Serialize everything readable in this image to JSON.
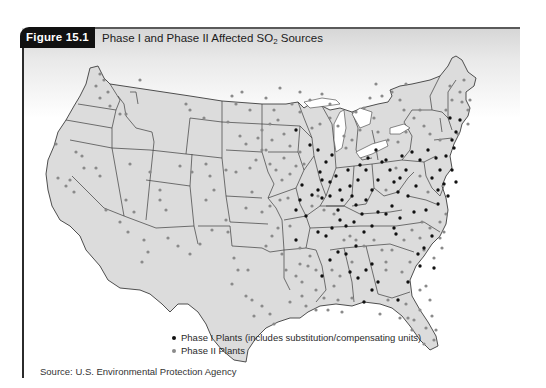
{
  "figure": {
    "label": "Figure 15.1",
    "title_prefix": "Phase I and Phase II Affected SO",
    "title_subscript": "2",
    "title_suffix": " Sources"
  },
  "legend": {
    "items": [
      {
        "label": "Phase I Plants (includes substitution/compensating units)",
        "color": "#111111"
      },
      {
        "label": "Phase II Plants",
        "color": "#8a8a8a"
      }
    ]
  },
  "source": "Source: U.S. Environmental Protection Agency",
  "colors": {
    "land": "#dcdcdc",
    "border": "#3c3c3c",
    "phase1": "#111111",
    "phase2": "#8a8a8a"
  },
  "map": {
    "phase1_points": [
      [
        296,
        130
      ],
      [
        310,
        145
      ],
      [
        318,
        150
      ],
      [
        332,
        155
      ],
      [
        326,
        162
      ],
      [
        320,
        172
      ],
      [
        322,
        180
      ],
      [
        318,
        190
      ],
      [
        312,
        195
      ],
      [
        302,
        185
      ],
      [
        300,
        200
      ],
      [
        296,
        210
      ],
      [
        330,
        182
      ],
      [
        336,
        176
      ],
      [
        340,
        190
      ],
      [
        342,
        200
      ],
      [
        338,
        210
      ],
      [
        348,
        170
      ],
      [
        350,
        186
      ],
      [
        352,
        196
      ],
      [
        356,
        205
      ],
      [
        358,
        180
      ],
      [
        360,
        165
      ],
      [
        366,
        170
      ],
      [
        368,
        158
      ],
      [
        376,
        150
      ],
      [
        386,
        160
      ],
      [
        378,
        180
      ],
      [
        372,
        190
      ],
      [
        366,
        200
      ],
      [
        362,
        214
      ],
      [
        354,
        222
      ],
      [
        346,
        226
      ],
      [
        340,
        220
      ],
      [
        332,
        228
      ],
      [
        326,
        236
      ],
      [
        318,
        232
      ],
      [
        306,
        216
      ],
      [
        382,
        162
      ],
      [
        390,
        170
      ],
      [
        394,
        182
      ],
      [
        400,
        178
      ],
      [
        406,
        170
      ],
      [
        402,
        156
      ],
      [
        412,
        152
      ],
      [
        420,
        160
      ],
      [
        428,
        150
      ],
      [
        436,
        158
      ],
      [
        440,
        170
      ],
      [
        444,
        184
      ],
      [
        438,
        190
      ],
      [
        432,
        178
      ],
      [
        416,
        186
      ],
      [
        408,
        196
      ],
      [
        398,
        192
      ],
      [
        392,
        206
      ],
      [
        386,
        214
      ],
      [
        378,
        212
      ],
      [
        372,
        226
      ],
      [
        364,
        232
      ],
      [
        356,
        246
      ],
      [
        346,
        254
      ],
      [
        338,
        252
      ],
      [
        330,
        260
      ],
      [
        322,
        276
      ],
      [
        350,
        272
      ],
      [
        358,
        278
      ],
      [
        366,
        270
      ],
      [
        372,
        264
      ],
      [
        378,
        282
      ],
      [
        372,
        290
      ],
      [
        364,
        302
      ],
      [
        394,
        228
      ],
      [
        396,
        234
      ],
      [
        398,
        300
      ],
      [
        418,
        254
      ],
      [
        420,
        266
      ],
      [
        424,
        248
      ],
      [
        408,
        282
      ],
      [
        434,
        268
      ],
      [
        432,
        236
      ],
      [
        400,
        218
      ],
      [
        296,
        240
      ],
      [
        446,
        156
      ],
      [
        452,
        170
      ],
      [
        456,
        182
      ],
      [
        448,
        196
      ],
      [
        438,
        204
      ],
      [
        426,
        210
      ],
      [
        414,
        212
      ],
      [
        452,
        140
      ],
      [
        456,
        132
      ],
      [
        460,
        120
      ],
      [
        450,
        118
      ],
      [
        454,
        148
      ],
      [
        322,
        198
      ],
      [
        330,
        196
      ]
    ],
    "phase2_points": [
      [
        100,
        74
      ],
      [
        104,
        80
      ],
      [
        96,
        86
      ],
      [
        108,
        92
      ],
      [
        100,
        98
      ],
      [
        140,
        80
      ],
      [
        110,
        106
      ],
      [
        120,
        114
      ],
      [
        126,
        114
      ],
      [
        186,
        104
      ],
      [
        190,
        110
      ],
      [
        204,
        118
      ],
      [
        232,
        96
      ],
      [
        236,
        104
      ],
      [
        242,
        92
      ],
      [
        228,
        122
      ],
      [
        250,
        110
      ],
      [
        56,
        144
      ],
      [
        76,
        152
      ],
      [
        82,
        156
      ],
      [
        84,
        168
      ],
      [
        58,
        178
      ],
      [
        70,
        180
      ],
      [
        66,
        186
      ],
      [
        74,
        192
      ],
      [
        96,
        168
      ],
      [
        100,
        176
      ],
      [
        130,
        164
      ],
      [
        150,
        172
      ],
      [
        160,
        190
      ],
      [
        160,
        200
      ],
      [
        166,
        210
      ],
      [
        180,
        166
      ],
      [
        192,
        172
      ],
      [
        206,
        164
      ],
      [
        210,
        176
      ],
      [
        214,
        190
      ],
      [
        206,
        200
      ],
      [
        226,
        170
      ],
      [
        236,
        172
      ],
      [
        250,
        168
      ],
      [
        256,
        160
      ],
      [
        262,
        150
      ],
      [
        270,
        164
      ],
      [
        276,
        170
      ],
      [
        282,
        180
      ],
      [
        290,
        174
      ],
      [
        252,
        192
      ],
      [
        246,
        208
      ],
      [
        262,
        212
      ],
      [
        270,
        206
      ],
      [
        280,
        200
      ],
      [
        288,
        198
      ],
      [
        226,
        220
      ],
      [
        228,
        232
      ],
      [
        212,
        230
      ],
      [
        200,
        244
      ],
      [
        190,
        254
      ],
      [
        178,
        246
      ],
      [
        144,
        240
      ],
      [
        148,
        252
      ],
      [
        142,
        262
      ],
      [
        168,
        238
      ],
      [
        126,
        200
      ],
      [
        134,
        212
      ],
      [
        120,
        222
      ],
      [
        128,
        232
      ],
      [
        106,
        210
      ],
      [
        234,
        258
      ],
      [
        238,
        270
      ],
      [
        232,
        284
      ],
      [
        248,
        270
      ],
      [
        246,
        296
      ],
      [
        252,
        300
      ],
      [
        266,
        246
      ],
      [
        272,
        236
      ],
      [
        278,
        228
      ],
      [
        290,
        226
      ],
      [
        282,
        254
      ],
      [
        286,
        270
      ],
      [
        296,
        276
      ],
      [
        302,
        282
      ],
      [
        302,
        296
      ],
      [
        290,
        302
      ],
      [
        262,
        306
      ],
      [
        270,
        314
      ],
      [
        254,
        316
      ],
      [
        274,
        324
      ],
      [
        300,
        248
      ],
      [
        310,
        256
      ],
      [
        308,
        266
      ],
      [
        316,
        290
      ],
      [
        324,
        298
      ],
      [
        334,
        286
      ],
      [
        338,
        300
      ],
      [
        306,
        306
      ],
      [
        316,
        310
      ],
      [
        328,
        310
      ],
      [
        342,
        312
      ],
      [
        352,
        298
      ],
      [
        340,
        276
      ],
      [
        356,
        240
      ],
      [
        374,
        240
      ],
      [
        382,
        250
      ],
      [
        386,
        262
      ],
      [
        392,
        250
      ],
      [
        404,
        240
      ],
      [
        412,
        230
      ],
      [
        422,
        222
      ],
      [
        430,
        228
      ],
      [
        440,
        222
      ],
      [
        446,
        214
      ],
      [
        440,
        238
      ],
      [
        442,
        248
      ],
      [
        434,
        258
      ],
      [
        426,
        286
      ],
      [
        430,
        300
      ],
      [
        420,
        310
      ],
      [
        414,
        320
      ],
      [
        400,
        318
      ],
      [
        406,
        304
      ],
      [
        388,
        300
      ],
      [
        380,
        314
      ],
      [
        386,
        270
      ],
      [
        402,
        272
      ],
      [
        410,
        262
      ],
      [
        262,
        130
      ],
      [
        270,
        124
      ],
      [
        278,
        120
      ],
      [
        284,
        134
      ],
      [
        272,
        140
      ],
      [
        266,
        150
      ],
      [
        290,
        146
      ],
      [
        300,
        152
      ],
      [
        304,
        164
      ],
      [
        296,
        166
      ],
      [
        284,
        158
      ],
      [
        312,
        128
      ],
      [
        320,
        124
      ],
      [
        330,
        118
      ],
      [
        338,
        126
      ],
      [
        344,
        136
      ],
      [
        346,
        148
      ],
      [
        352,
        140
      ],
      [
        360,
        130
      ],
      [
        356,
        112
      ],
      [
        364,
        108
      ],
      [
        374,
        118
      ],
      [
        378,
        132
      ],
      [
        388,
        140
      ],
      [
        398,
        142
      ],
      [
        406,
        132
      ],
      [
        414,
        118
      ],
      [
        420,
        110
      ],
      [
        424,
        126
      ],
      [
        430,
        134
      ],
      [
        440,
        140
      ],
      [
        446,
        110
      ],
      [
        452,
        100
      ],
      [
        460,
        92
      ],
      [
        462,
        102
      ],
      [
        464,
        80
      ],
      [
        310,
        100
      ],
      [
        322,
        94
      ],
      [
        330,
        104
      ],
      [
        266,
        98
      ],
      [
        280,
        88
      ],
      [
        292,
        104
      ],
      [
        300,
        92
      ],
      [
        300,
        112
      ],
      [
        274,
        110
      ],
      [
        246,
        144
      ],
      [
        240,
        136
      ],
      [
        258,
        138
      ],
      [
        382,
        96
      ],
      [
        392,
        92
      ],
      [
        400,
        100
      ],
      [
        404,
        110
      ],
      [
        370,
        98
      ],
      [
        376,
        84
      ],
      [
        406,
        84
      ],
      [
        450,
        86
      ],
      [
        468,
        110
      ],
      [
        470,
        100
      ],
      [
        468,
        124
      ],
      [
        458,
        134
      ],
      [
        408,
        318
      ],
      [
        420,
        290
      ],
      [
        424,
        250
      ],
      [
        318,
        196
      ],
      [
        312,
        206
      ],
      [
        324,
        210
      ],
      [
        334,
        214
      ],
      [
        344,
        240
      ],
      [
        350,
        236
      ],
      [
        364,
        246
      ],
      [
        396,
        168
      ],
      [
        386,
        190
      ],
      [
        420,
        176
      ],
      [
        428,
        192
      ],
      [
        444,
        232
      ],
      [
        420,
        238
      ],
      [
        352,
        262
      ],
      [
        332,
        270
      ],
      [
        316,
        270
      ],
      [
        300,
        264
      ],
      [
        432,
        316
      ],
      [
        426,
        328
      ],
      [
        436,
        330
      ],
      [
        434,
        340
      ],
      [
        424,
        344
      ],
      [
        412,
        330
      ]
    ]
  }
}
